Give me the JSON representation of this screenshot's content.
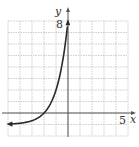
{
  "chart_data": {
    "type": "line",
    "title": "",
    "xlabel": "x",
    "ylabel": "y",
    "xlim": [
      -5,
      5
    ],
    "ylim": [
      -2,
      8
    ],
    "grid": true,
    "tick_labels": {
      "x": [
        "5"
      ],
      "y": [
        "8"
      ]
    },
    "series": [
      {
        "name": "curve",
        "function_estimate": "y = 3^(x+2) - 1",
        "x": [
          -5,
          -4,
          -3,
          -2,
          -1,
          -0.5,
          0
        ],
        "y": [
          -0.96,
          -0.89,
          -0.67,
          0,
          2,
          4.2,
          8
        ],
        "asymptote_y": -1,
        "arrows": "both ends"
      }
    ]
  },
  "labels": {
    "y_axis": "y",
    "x_axis": "x",
    "y_tick": "8",
    "x_tick": "5"
  },
  "colors": {
    "grid": "#b8b8b8",
    "axis": "#555555",
    "curve": "#2a2a2a"
  }
}
